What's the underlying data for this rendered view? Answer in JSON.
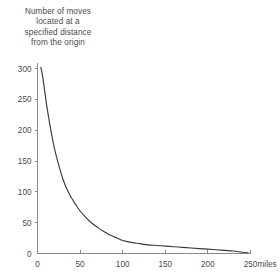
{
  "chart_data": {
    "type": "line",
    "title": "Number of moves located at a specified distance from the origin",
    "title_lines": [
      "Number of moves",
      "located at a",
      "specified distance",
      "from the origin"
    ],
    "xlabel": "miles",
    "ylabel": "",
    "xlim": [
      0,
      250
    ],
    "ylim": [
      0,
      310
    ],
    "grid": false,
    "legend": null,
    "x_ticks": [
      0,
      50,
      100,
      150,
      200,
      250
    ],
    "x_tick_labels": [
      "0",
      "50",
      "100",
      "150",
      "200",
      "250"
    ],
    "x_unit_label": "miles",
    "y_ticks": [
      0,
      50,
      100,
      150,
      200,
      250,
      300
    ],
    "y_tick_labels": [
      "0",
      "50",
      "100",
      "150",
      "200",
      "250",
      "300"
    ],
    "series": [
      {
        "name": "moves at distance",
        "x": [
          4,
          6,
          8,
          10,
          12,
          15,
          18,
          21,
          25,
          30,
          35,
          40,
          45,
          50,
          55,
          60,
          65,
          70,
          75,
          80,
          85,
          90,
          95,
          100,
          110,
          120,
          130,
          140,
          150,
          160,
          170,
          180,
          190,
          200,
          210,
          220,
          230,
          240,
          247
        ],
        "values": [
          302,
          288,
          268,
          248,
          230,
          205,
          183,
          164,
          143,
          120,
          103,
          90,
          79,
          69,
          61,
          54,
          48,
          43,
          38,
          34,
          30,
          27,
          24,
          21,
          18,
          16,
          14,
          13,
          12,
          11,
          10,
          9,
          8,
          7,
          6,
          5,
          4,
          2,
          1
        ]
      }
    ]
  },
  "axes": {
    "tick_color": "#8a8a8a",
    "curve_color": "#3c3c3c",
    "text_color": "#4a4a4a",
    "background": "#ffffff"
  }
}
